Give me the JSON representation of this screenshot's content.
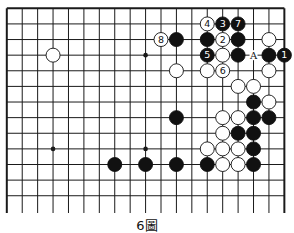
{
  "diagram": {
    "caption": "6圖",
    "grid": {
      "columns": 19,
      "rows": 13,
      "x0": 6.8,
      "y0": 8.3,
      "spacing_x": 15.42,
      "spacing_y": 15.62,
      "bottom_extend_y": 213,
      "open_bottom": true
    },
    "colors": {
      "line": "#1a1a1a",
      "black_stone": "#111111",
      "white_stone": "#ffffff"
    },
    "star_points": [
      [
        3,
        3
      ],
      [
        9,
        3
      ],
      [
        3,
        9
      ],
      [
        9,
        9
      ]
    ],
    "stones": [
      {
        "c": 13,
        "r": 1,
        "color": "white",
        "label": "4"
      },
      {
        "c": 14,
        "r": 1,
        "color": "black",
        "label": "3"
      },
      {
        "c": 15,
        "r": 1,
        "color": "black",
        "label": "7"
      },
      {
        "c": 10,
        "r": 2,
        "color": "white",
        "label": "8"
      },
      {
        "c": 11,
        "r": 2,
        "color": "black",
        "label": ""
      },
      {
        "c": 13,
        "r": 2,
        "color": "black",
        "label": ""
      },
      {
        "c": 14,
        "r": 2,
        "color": "white",
        "label": "2"
      },
      {
        "c": 15,
        "r": 2,
        "color": "black",
        "label": ""
      },
      {
        "c": 17,
        "r": 2,
        "color": "white",
        "label": ""
      },
      {
        "c": 3,
        "r": 3,
        "color": "white",
        "label": ""
      },
      {
        "c": 13,
        "r": 3,
        "color": "black",
        "label": "5"
      },
      {
        "c": 14,
        "r": 3,
        "color": "white",
        "label": ""
      },
      {
        "c": 15,
        "r": 3,
        "color": "black",
        "label": ""
      },
      {
        "c": 17,
        "r": 3,
        "color": "black",
        "label": ""
      },
      {
        "c": 18,
        "r": 3,
        "color": "black",
        "label": "1"
      },
      {
        "c": 11,
        "r": 4,
        "color": "white",
        "label": ""
      },
      {
        "c": 13,
        "r": 4,
        "color": "white",
        "label": ""
      },
      {
        "c": 14,
        "r": 4,
        "color": "white",
        "label": "6"
      },
      {
        "c": 17,
        "r": 4,
        "color": "white",
        "label": ""
      },
      {
        "c": 15,
        "r": 5,
        "color": "white",
        "label": ""
      },
      {
        "c": 16,
        "r": 5,
        "color": "white",
        "label": ""
      },
      {
        "c": 16,
        "r": 6,
        "color": "black",
        "label": ""
      },
      {
        "c": 17,
        "r": 6,
        "color": "white",
        "label": ""
      },
      {
        "c": 11,
        "r": 7,
        "color": "black",
        "label": ""
      },
      {
        "c": 14,
        "r": 7,
        "color": "white",
        "label": ""
      },
      {
        "c": 15,
        "r": 7,
        "color": "white",
        "label": ""
      },
      {
        "c": 16,
        "r": 7,
        "color": "black",
        "label": ""
      },
      {
        "c": 17,
        "r": 7,
        "color": "black",
        "label": ""
      },
      {
        "c": 14,
        "r": 8,
        "color": "white",
        "label": ""
      },
      {
        "c": 15,
        "r": 8,
        "color": "black",
        "label": ""
      },
      {
        "c": 16,
        "r": 8,
        "color": "black",
        "label": ""
      },
      {
        "c": 13,
        "r": 9,
        "color": "white",
        "label": ""
      },
      {
        "c": 14,
        "r": 9,
        "color": "white",
        "label": ""
      },
      {
        "c": 15,
        "r": 9,
        "color": "white",
        "label": ""
      },
      {
        "c": 16,
        "r": 9,
        "color": "black",
        "label": ""
      },
      {
        "c": 7,
        "r": 10,
        "color": "black",
        "label": ""
      },
      {
        "c": 9,
        "r": 10,
        "color": "black",
        "label": ""
      },
      {
        "c": 11,
        "r": 10,
        "color": "black",
        "label": ""
      },
      {
        "c": 13,
        "r": 10,
        "color": "black",
        "label": ""
      },
      {
        "c": 14,
        "r": 10,
        "color": "white",
        "label": ""
      },
      {
        "c": 15,
        "r": 10,
        "color": "white",
        "label": ""
      },
      {
        "c": 16,
        "r": 10,
        "color": "black",
        "label": ""
      }
    ],
    "markers": [
      {
        "c": 16,
        "r": 3,
        "label": "A"
      }
    ]
  }
}
